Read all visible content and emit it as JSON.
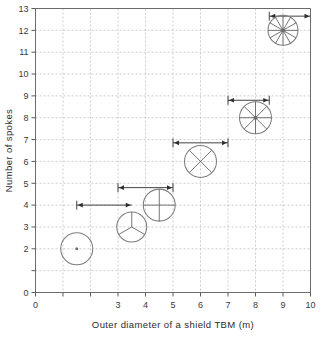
{
  "chart_data": {
    "type": "scatter",
    "title": "",
    "xlabel": "Outer diameter of a shield TBM (m)",
    "ylabel": "Number of spokes",
    "xlim": [
      0,
      10
    ],
    "ylim": [
      0,
      13
    ],
    "grid": true,
    "legend": "none",
    "x_ticks": [
      0,
      1,
      2,
      3,
      4,
      5,
      6,
      7,
      8,
      9,
      10
    ],
    "x_tick_labels": [
      "0",
      "",
      "",
      "3",
      "4",
      "5",
      "6",
      "7",
      "8",
      "9",
      "10"
    ],
    "y_ticks": [
      0,
      1,
      2,
      3,
      4,
      5,
      6,
      7,
      8,
      9,
      10,
      11,
      12,
      13
    ],
    "y_tick_labels": [
      "0",
      "",
      "2",
      "3",
      "4",
      "5",
      "6",
      "7",
      "8",
      "9",
      "10",
      "11",
      "12",
      "13"
    ],
    "x": [
      1.5,
      3.5,
      4.5,
      6,
      8,
      9
    ],
    "y": [
      2,
      3,
      4,
      6,
      8,
      12
    ],
    "points": [
      {
        "label": "cutterhead-2-spokes",
        "x": 1.5,
        "y": 2,
        "spokes": 0,
        "radius_px": 16,
        "pattern": "plain"
      },
      {
        "label": "cutterhead-3-spokes",
        "x": 3.5,
        "y": 3,
        "spokes": 3,
        "radius_px": 15,
        "pattern": "y"
      },
      {
        "label": "cutterhead-4-spokes",
        "x": 4.5,
        "y": 4,
        "spokes": 4,
        "radius_px": 16,
        "pattern": "plus"
      },
      {
        "label": "cutterhead-6-spokes",
        "x": 6,
        "y": 6,
        "spokes": 4,
        "radius_px": 16,
        "pattern": "cross"
      },
      {
        "label": "cutterhead-8-spokes",
        "x": 8,
        "y": 8,
        "spokes": 8,
        "radius_px": 16,
        "pattern": "radial"
      },
      {
        "label": "cutterhead-12-spokes",
        "x": 9,
        "y": 12,
        "spokes": 12,
        "radius_px": 15,
        "pattern": "radial"
      }
    ],
    "range_arrows": [
      {
        "label": "range-2-spokes",
        "x_start": 1.5,
        "x_end": 3.5,
        "y": 4.0,
        "cap_start": true,
        "head_start": true,
        "cap_end": false,
        "head_end": true
      },
      {
        "label": "range-3-spokes",
        "x_start": 3.0,
        "x_end": 5.0,
        "y": 4.8,
        "cap_start": true,
        "head_start": true,
        "cap_end": true,
        "head_end": true
      },
      {
        "label": "range-4-spokes",
        "x_start": 5.0,
        "x_end": 7.0,
        "y": 6.85,
        "cap_start": true,
        "head_start": true,
        "cap_end": true,
        "head_end": true
      },
      {
        "label": "range-8-spokes",
        "x_start": 7.0,
        "x_end": 8.5,
        "y": 8.8,
        "cap_start": true,
        "head_start": true,
        "cap_end": true,
        "head_end": true
      },
      {
        "label": "range-12-spokes",
        "x_start": 8.5,
        "x_end": 10.0,
        "y": 12.65,
        "cap_start": true,
        "head_start": true,
        "cap_end": false,
        "head_end": true
      }
    ]
  }
}
